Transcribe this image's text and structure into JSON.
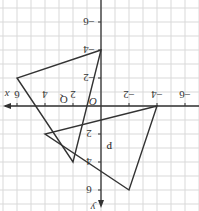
{
  "figure": {
    "type": "coordinate-plane",
    "orientation": "rotated 180 degrees",
    "axes": {
      "x_label": "x",
      "y_label": "y",
      "origin_label": "O",
      "x_ticks": [
        "-6",
        "-4",
        "-2",
        "2",
        "4",
        "6"
      ],
      "y_ticks": [
        "-6",
        "-4",
        "-2",
        "2",
        "4",
        "6"
      ]
    },
    "shapes": [
      {
        "label": "Q",
        "vertices": [
          [
            0,
            -4
          ],
          [
            6,
            -2
          ],
          [
            2,
            4
          ]
        ]
      },
      {
        "label": "P",
        "vertices": [
          [
            -4,
            0
          ],
          [
            4,
            2
          ],
          [
            -2,
            6
          ]
        ]
      }
    ],
    "colors": {
      "line": "#333333",
      "grid": "#d9d9d9",
      "background": "#ffffff"
    }
  }
}
